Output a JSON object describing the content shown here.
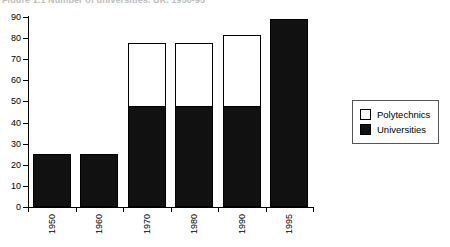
{
  "chart_data": {
    "type": "bar",
    "title": "Figure 1.1  Number of universities, UK, 1950-95",
    "xlabel": "",
    "ylabel": "",
    "categories": [
      "1950",
      "1960",
      "1970",
      "1980",
      "1990",
      "1995"
    ],
    "series": [
      {
        "name": "Universities",
        "color": "#111111",
        "values": [
          25,
          25,
          48,
          48,
          48,
          89
        ]
      },
      {
        "name": "Polytechnics",
        "color": "#ffffff",
        "values": [
          0,
          0,
          30,
          30,
          34,
          0
        ]
      }
    ],
    "totals": [
      25,
      25,
      78,
      78,
      82,
      89
    ],
    "stacked": true,
    "ylim": [
      0,
      90
    ],
    "ytick_labels": [
      "90",
      "80",
      "70",
      "60",
      "50",
      "40",
      "30",
      "20",
      "10",
      "0"
    ],
    "ytick_values": [
      90,
      80,
      70,
      60,
      50,
      40,
      30,
      20,
      10,
      0
    ],
    "grid": false,
    "legend_position": "right",
    "legend_entries": [
      {
        "label": "Polytechnics",
        "swatch": "#ffffff"
      },
      {
        "label": "Universities",
        "swatch": "#111111"
      }
    ]
  }
}
